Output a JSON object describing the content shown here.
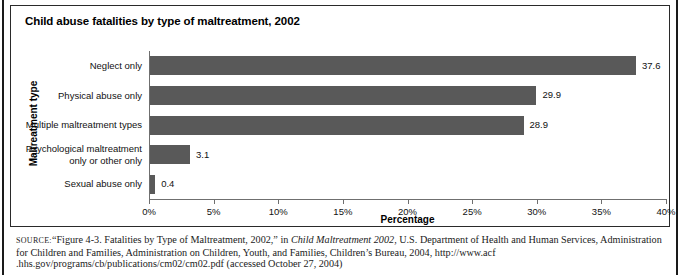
{
  "panel": {
    "title": "Child abuse fatalities by type of maltreatment, 2002"
  },
  "chart_data": {
    "type": "bar",
    "orientation": "horizontal",
    "title": "Child abuse fatalities by type of maltreatment, 2002",
    "xlabel": "Percentage",
    "ylabel": "Maltreatment type",
    "xlim": [
      0,
      40
    ],
    "xtick_labels": [
      "0%",
      "5%",
      "10%",
      "15%",
      "20%",
      "25%",
      "30%",
      "35%",
      "40%"
    ],
    "xticks": [
      0,
      5,
      10,
      15,
      20,
      25,
      30,
      35,
      40
    ],
    "grid": false,
    "legend": "none",
    "bar_color": "#595959",
    "categories": [
      "Neglect only",
      "Physical abuse only",
      "Multiple maltreatment types",
      "Psychological maltreatment only or other only",
      "Sexual abuse only"
    ],
    "category_lines": [
      [
        "Neglect only"
      ],
      [
        "Physical abuse only"
      ],
      [
        "Multiple maltreatment types"
      ],
      [
        "Psychological maltreatment",
        "only or other only"
      ],
      [
        "Sexual abuse only"
      ]
    ],
    "values": [
      37.6,
      29.9,
      28.9,
      3.1,
      0.4
    ],
    "value_labels": [
      "37.6",
      "29.9",
      "28.9",
      "3.1",
      "0.4"
    ]
  },
  "source": {
    "kicker": "SOURCE:",
    "part1": "“Figure 4-3. Fatalities by Type of Maltreatment, 2002,” in ",
    "italic_title": "Child Maltreatment 2002",
    "part2": ", U.S. Department of Health and Human Services, Administration for Children and Families, Administration on Children, Youth, and Families, Children’s Bureau, 2004, http://www.acf .hhs.gov/programs/cb/publications/cm02/cm02.pdf (accessed October 27, 2004)"
  }
}
